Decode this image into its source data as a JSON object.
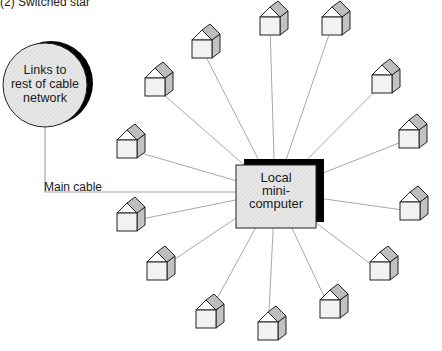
{
  "title": "(2) Switched star",
  "hub": {
    "label_lines": [
      "Local",
      "mini-",
      "computer"
    ],
    "center": [
      275,
      192
    ],
    "box": {
      "x": 236,
      "y": 165,
      "w": 80,
      "h": 63
    }
  },
  "network_node": {
    "label_lines": [
      "Links to",
      "rest of cable",
      "network"
    ],
    "center": [
      45,
      85
    ],
    "radius": 42
  },
  "main_cable_label": "Main cable",
  "colors": {
    "line": "#a8a8a8",
    "stroke": "#222222",
    "shadow": "#000000",
    "fill_light": "#ececec",
    "roof_dark": "#bdbdbd"
  },
  "houses": [
    {
      "x": 192,
      "y": 40
    },
    {
      "x": 260,
      "y": 17
    },
    {
      "x": 322,
      "y": 17
    },
    {
      "x": 372,
      "y": 75
    },
    {
      "x": 399,
      "y": 130
    },
    {
      "x": 400,
      "y": 202
    },
    {
      "x": 370,
      "y": 262
    },
    {
      "x": 320,
      "y": 300
    },
    {
      "x": 258,
      "y": 322
    },
    {
      "x": 196,
      "y": 310
    },
    {
      "x": 147,
      "y": 262
    },
    {
      "x": 117,
      "y": 213
    },
    {
      "x": 117,
      "y": 140
    },
    {
      "x": 145,
      "y": 78
    }
  ]
}
